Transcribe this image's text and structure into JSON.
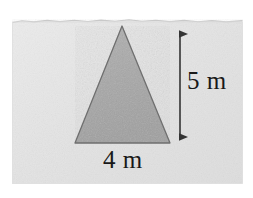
{
  "figure": {
    "kind": "geometry-diagram",
    "canvas": {
      "width": 253,
      "height": 198,
      "background_color": "#ffffff"
    },
    "photo_region": {
      "name": "scanned-photo-background",
      "fill_color": "#e6e6e6",
      "edge_color": "#d2d2d2",
      "x": 12,
      "y": 19,
      "width": 231,
      "height": 165,
      "texture": "fine grain noise"
    },
    "shape": {
      "name": "triangle",
      "type": "isosceles-triangle",
      "fill_color": "#a9a9a9",
      "stroke_color": "#6e6e6e",
      "apex": {
        "x": 122,
        "y": 26
      },
      "base_left": {
        "x": 75,
        "y": 143
      },
      "base_right": {
        "x": 170,
        "y": 143
      }
    },
    "dimensions": [
      {
        "id": "height",
        "label": "5 m",
        "value": 5,
        "unit": "m",
        "orientation": "vertical",
        "line_color": "#3c3c3c",
        "line_x": 180,
        "line_y_start": 26,
        "line_y_end": 145,
        "arrowheads": "both"
      },
      {
        "id": "base",
        "label": "4 m",
        "value": 4,
        "unit": "m",
        "orientation": "horizontal",
        "line_color": "#6e6e6e"
      }
    ]
  }
}
